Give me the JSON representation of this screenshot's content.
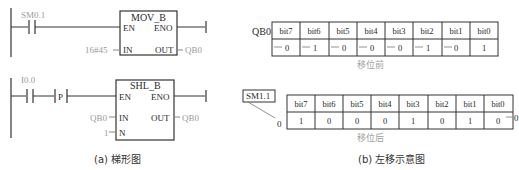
{
  "ladder": {
    "rung1": {
      "contact": "SM0.1",
      "block": {
        "title": "MOV_B",
        "en": "EN",
        "eno": "ENO",
        "in": "IN",
        "out": "OUT"
      },
      "in_value": "16#45",
      "out_value": "QB0"
    },
    "rung2": {
      "contact": "I0.0",
      "pulse": "P",
      "block": {
        "title": "SHL_B",
        "en": "EN",
        "eno": "ENO",
        "in": "IN",
        "out": "OUT",
        "n": "N"
      },
      "in_value": "QB0",
      "out_value": "QB0",
      "n_value": "1"
    },
    "caption": "(a) 梯形图"
  },
  "shift": {
    "before": {
      "label": "QB0",
      "headers": [
        "bit7",
        "bit6",
        "bit5",
        "bit4",
        "bit3",
        "bit2",
        "bit1",
        "bit0"
      ],
      "values": [
        "0",
        "1",
        "0",
        "0",
        "0",
        "1",
        "0",
        "1"
      ],
      "note": "移位前"
    },
    "after": {
      "flag": "SM1.1",
      "flag_value": "0",
      "headers": [
        "bit7",
        "bit6",
        "bit5",
        "bit4",
        "bit3",
        "bit2",
        "bit1",
        "bit0"
      ],
      "values": [
        "1",
        "0",
        "0",
        "0",
        "1",
        "0",
        "1",
        "0"
      ],
      "fill_in": "0",
      "note": "移位后"
    },
    "caption": "(b) 左移示意图"
  }
}
